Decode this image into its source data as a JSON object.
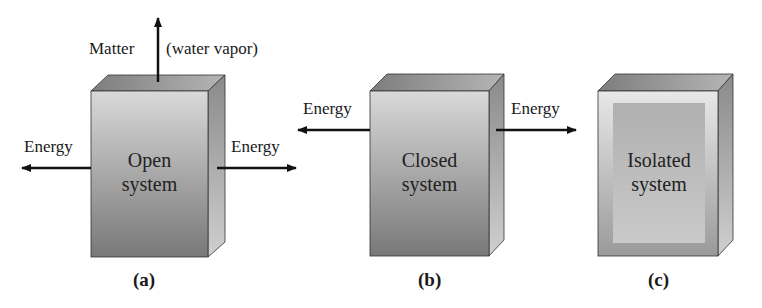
{
  "figure": {
    "panels": [
      {
        "id": "a",
        "caption": "(a)",
        "box_label_line1": "Open",
        "box_label_line2": "system",
        "left_arrow_label": "Energy",
        "right_arrow_label": "Energy",
        "top_arrow_label_left": "Matter",
        "top_arrow_label_right": "(water vapor)"
      },
      {
        "id": "b",
        "caption": "(b)",
        "box_label_line1": "Closed",
        "box_label_line2": "system",
        "left_arrow_label": "Energy",
        "right_arrow_label": "Energy"
      },
      {
        "id": "c",
        "caption": "(c)",
        "box_label_line1": "Isolated",
        "box_label_line2": "system"
      }
    ],
    "colors": {
      "box_front_top": "#d6d6d6",
      "box_front_bottom": "#7a7a7a",
      "box_top": "#8a8a8a",
      "box_side": "#9a9a9a",
      "arrow": "#111111",
      "isolated_frame": "#c8c8c8",
      "isolated_inner": "#a8a8a8"
    }
  }
}
